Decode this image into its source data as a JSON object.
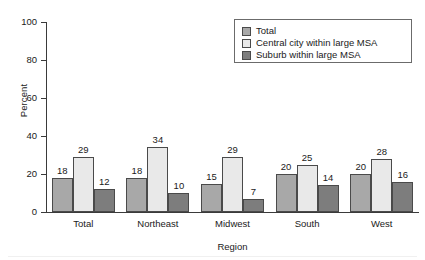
{
  "chart_data": {
    "type": "bar",
    "title": "",
    "xlabel": "Region",
    "ylabel": "Percent",
    "categories": [
      "Total",
      "Northeast",
      "Midwest",
      "South",
      "West"
    ],
    "series": [
      {
        "name": "Total",
        "color": "#a8a8a8",
        "values": [
          18,
          18,
          15,
          20,
          20
        ]
      },
      {
        "name": "Central city within large MSA",
        "color": "#e9e9e9",
        "values": [
          29,
          34,
          29,
          25,
          28
        ]
      },
      {
        "name": "Suburb within large MSA",
        "color": "#7d7d7d",
        "values": [
          12,
          10,
          7,
          14,
          16
        ]
      }
    ],
    "ylim": [
      0,
      100
    ],
    "yticks": [
      0,
      20,
      40,
      60,
      80,
      100
    ],
    "ytick_labels": [
      "0",
      "20",
      "40",
      "60",
      "80",
      "100"
    ],
    "grid": false,
    "legend_position": "top-right",
    "data_labels": true
  },
  "axes": {
    "y_title": "Percent",
    "x_title": "Region",
    "y_tick_labels": [
      "100",
      "80",
      "60",
      "40",
      "20",
      "0"
    ]
  },
  "legend": {
    "items": [
      {
        "label": "Total",
        "color": "#a8a8a8"
      },
      {
        "label": "Central city within large MSA",
        "color": "#e9e9e9"
      },
      {
        "label": "Suburb within large MSA",
        "color": "#7d7d7d"
      }
    ]
  },
  "groups": [
    {
      "label": "Total",
      "bars": [
        {
          "series": "Total",
          "value": 18,
          "label": "18",
          "color": "#a8a8a8"
        },
        {
          "series": "Central city within large MSA",
          "value": 29,
          "label": "29",
          "color": "#e9e9e9"
        },
        {
          "series": "Suburb within large MSA",
          "value": 12,
          "label": "12",
          "color": "#7d7d7d"
        }
      ]
    },
    {
      "label": "Northeast",
      "bars": [
        {
          "series": "Total",
          "value": 18,
          "label": "18",
          "color": "#a8a8a8"
        },
        {
          "series": "Central city within large MSA",
          "value": 34,
          "label": "34",
          "color": "#e9e9e9"
        },
        {
          "series": "Suburb within large MSA",
          "value": 10,
          "label": "10",
          "color": "#7d7d7d"
        }
      ]
    },
    {
      "label": "Midwest",
      "bars": [
        {
          "series": "Total",
          "value": 15,
          "label": "15",
          "color": "#a8a8a8"
        },
        {
          "series": "Central city within large MSA",
          "value": 29,
          "label": "29",
          "color": "#e9e9e9"
        },
        {
          "series": "Suburb within large MSA",
          "value": 7,
          "label": "7",
          "color": "#7d7d7d"
        }
      ]
    },
    {
      "label": "South",
      "bars": [
        {
          "series": "Total",
          "value": 20,
          "label": "20",
          "color": "#a8a8a8"
        },
        {
          "series": "Central city within large MSA",
          "value": 25,
          "label": "25",
          "color": "#e9e9e9"
        },
        {
          "series": "Suburb within large MSA",
          "value": 14,
          "label": "14",
          "color": "#7d7d7d"
        }
      ]
    },
    {
      "label": "West",
      "bars": [
        {
          "series": "Total",
          "value": 20,
          "label": "20",
          "color": "#a8a8a8"
        },
        {
          "series": "Central city within large MSA",
          "value": 28,
          "label": "28",
          "color": "#e9e9e9"
        },
        {
          "series": "Suburb within large MSA",
          "value": 16,
          "label": "16",
          "color": "#7d7d7d"
        }
      ]
    }
  ]
}
